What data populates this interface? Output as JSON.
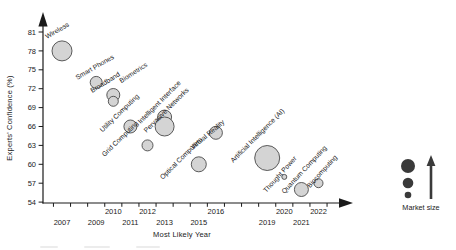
{
  "chart_data": {
    "type": "scatter",
    "subtype": "bubble",
    "title": "",
    "xlabel": "Most Likely Year",
    "ylabel": "Experts' Confidence (%)",
    "y_ticks": [
      54,
      57,
      60,
      63,
      66,
      69,
      72,
      75,
      78,
      81
    ],
    "x_tick_rows": {
      "top": [
        2010,
        2012,
        2016,
        2020,
        2022
      ],
      "bottom": [
        2007,
        2009,
        2011,
        2013,
        2015,
        2019,
        2021
      ]
    },
    "x_range": [
      2006,
      2023
    ],
    "y_range": [
      52.5,
      83
    ],
    "grid": false,
    "bubble_fill": "#d4d4d4",
    "bubble_stroke": "#4a4a4a",
    "points": [
      {
        "label": "Wireless",
        "year": 2007,
        "confidence": 78,
        "size": 10,
        "label_dx": -15,
        "label_dy": -12,
        "angle": -30
      },
      {
        "label": "Smart Phones",
        "year": 2009,
        "confidence": 73,
        "size": 6,
        "label_dx": -19,
        "label_dy": -2.5,
        "angle": -30
      },
      {
        "label": "Broadband",
        "year": 2010,
        "confidence": 71,
        "size": 6.5,
        "label_dx": -21,
        "label_dy": -2,
        "angle": -32
      },
      {
        "label": "Biometrics",
        "year": 2010,
        "confidence": 70,
        "size": 5,
        "label_dx": 8,
        "label_dy": -18,
        "angle": -33
      },
      {
        "label": "Utility Computing",
        "year": 2011,
        "confidence": 66,
        "size": 6.5,
        "label_dx": -28,
        "label_dy": 6,
        "angle": -44
      },
      {
        "label": "Intelligent Interface",
        "year": 2013,
        "confidence": 67.5,
        "size": 7,
        "label_dx": -24,
        "label_dy": 7,
        "angle": -45
      },
      {
        "label": "Pervasive Networks",
        "year": 2013,
        "confidence": 66,
        "size": 9.5,
        "label_dx": -18,
        "label_dy": 6.5,
        "angle": -45
      },
      {
        "label": "Grid Computing",
        "year": 2012,
        "confidence": 63,
        "size": 5.5,
        "label_dx": -43,
        "label_dy": 11.5,
        "angle": -44
      },
      {
        "label": "Optical Computers",
        "year": 2015,
        "confidence": 60,
        "size": 7.5,
        "label_dx": -36,
        "label_dy": 15.5,
        "angle": -45
      },
      {
        "label": "Virtual Reality",
        "year": 2016,
        "confidence": 65,
        "size": 6.5,
        "label_dx": -23,
        "label_dy": 17,
        "angle": -40
      },
      {
        "label": "Artificial Intelligence (AI)",
        "year": 2019,
        "confidence": 61,
        "size": 12.5,
        "label_dx": -34,
        "label_dy": 5,
        "angle": -45
      },
      {
        "label": "Thought Power",
        "year": 2020,
        "confidence": 58,
        "size": 2.5,
        "label_dx": -18,
        "label_dy": 16,
        "angle": -48
      },
      {
        "label": "Quantum Computing",
        "year": 2021,
        "confidence": 56,
        "size": 7,
        "label_dx": -17,
        "label_dy": 4.5,
        "angle": -47
      },
      {
        "label": "Biocomputing",
        "year": 2022,
        "confidence": 57,
        "size": 4.5,
        "label_dx": -8.5,
        "label_dy": 5,
        "angle": -48
      }
    ],
    "legend": {
      "label": "Market size",
      "meaning": "bubble area encodes market size",
      "circle_radii": [
        7,
        5.3,
        3.3
      ],
      "color": "#3a3a3a",
      "position": "right",
      "arrow_direction": "up"
    }
  }
}
